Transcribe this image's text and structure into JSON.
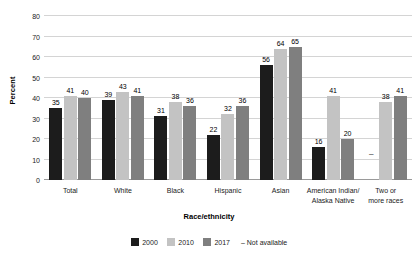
{
  "chart_data": {
    "type": "bar",
    "title": "",
    "xlabel": "Race/ethnicity",
    "ylabel": "Percent",
    "ylim": [
      0,
      80
    ],
    "yticks": [
      0,
      10,
      20,
      30,
      40,
      50,
      60,
      70,
      80
    ],
    "grid": true,
    "legend_position": "bottom",
    "categories": [
      "Total",
      "White",
      "Black",
      "Hispanic",
      "Asian",
      "American Indian/\nAlaska Native",
      "Two or\nmore races"
    ],
    "category_lines": [
      [
        "Total"
      ],
      [
        "White"
      ],
      [
        "Black"
      ],
      [
        "Hispanic"
      ],
      [
        "Asian"
      ],
      [
        "American Indian/",
        "Alaska Native"
      ],
      [
        "Two or",
        "more races"
      ]
    ],
    "series": [
      {
        "name": "2000",
        "color": "#1c1c1c",
        "values": [
          35,
          39,
          31,
          22,
          56,
          16,
          null
        ],
        "labels": [
          "35",
          "39",
          "31",
          "22",
          "56",
          "16",
          "–"
        ]
      },
      {
        "name": "2010",
        "color": "#c3c3c3",
        "values": [
          41,
          43,
          38,
          32,
          64,
          41,
          38
        ],
        "labels": [
          "41",
          "43",
          "38",
          "32",
          "64",
          "41",
          "38"
        ]
      },
      {
        "name": "2017",
        "color": "#7f7f7f",
        "values": [
          40,
          41,
          36,
          36,
          65,
          20,
          41
        ],
        "labels": [
          "40",
          "41",
          "36",
          "36",
          "65",
          "20",
          "41"
        ]
      }
    ],
    "not_available_symbol": "–",
    "not_available_note": "Not available"
  },
  "legend": {
    "items": [
      {
        "label": "2000",
        "color": "#1c1c1c"
      },
      {
        "label": "2010",
        "color": "#c3c3c3"
      },
      {
        "label": "2017",
        "color": "#7f7f7f"
      }
    ],
    "note": "– Not available"
  }
}
